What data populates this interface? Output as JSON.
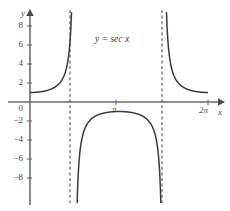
{
  "chart_data": {
    "type": "line",
    "title": "",
    "annotation": "y = sec x",
    "xlabel": "x",
    "ylabel": "y",
    "xlim": [
      -0.35,
      7.25
    ],
    "ylim": [
      -9.6,
      9.6
    ],
    "grid": false,
    "legend": null,
    "x_ticks": [
      {
        "value": 3.14159,
        "label": "π"
      },
      {
        "value": 6.28319,
        "label": "2π"
      }
    ],
    "y_ticks": [
      {
        "value": 8,
        "label": "8"
      },
      {
        "value": 6,
        "label": "6"
      },
      {
        "value": 4,
        "label": "4"
      },
      {
        "value": 2,
        "label": "2"
      },
      {
        "value": 0,
        "label": "0"
      },
      {
        "value": -2,
        "label": "−2"
      },
      {
        "value": -4,
        "label": "−4"
      },
      {
        "value": -6,
        "label": "−6"
      },
      {
        "value": -8,
        "label": "−8"
      }
    ],
    "asymptotes": [
      {
        "x": 1.5708,
        "label": "π/2",
        "style": "dashed"
      },
      {
        "x": 4.71239,
        "label": "3π/2",
        "style": "dashed"
      }
    ],
    "series": [
      {
        "name": "y = sec x",
        "function": "sec",
        "color": "#3a3a3a",
        "branches": [
          {
            "x_range": [
              0,
              1.5708
            ],
            "description": "rises from (0,1) to +infinity at pi/2"
          },
          {
            "x_range": [
              1.5708,
              4.71239
            ],
            "description": "from -infinity up to (pi,-1) then down to -infinity at 3pi/2"
          },
          {
            "x_range": [
              4.71239,
              6.28319
            ],
            "description": "descends from +infinity to (2pi,1)"
          }
        ],
        "key_points": [
          {
            "x": 0,
            "y": 1
          },
          {
            "x": 3.14159,
            "y": -1
          },
          {
            "x": 6.28319,
            "y": 1
          }
        ]
      }
    ],
    "colors": {
      "curve": "#3a3a3a",
      "axis": "#6b6b6b",
      "asymptote": "#555555",
      "text": "#4a4a4a",
      "background": "#ffffff"
    }
  }
}
